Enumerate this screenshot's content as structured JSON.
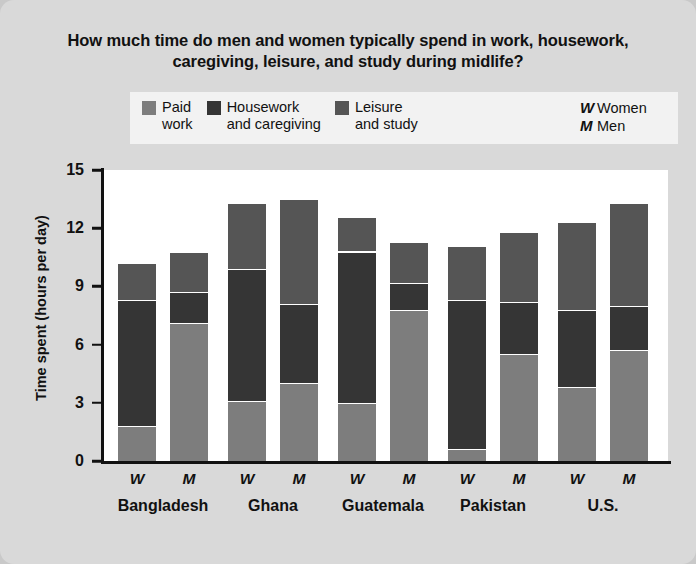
{
  "title": "How much time do men and women typically spend in work, housework, caregiving, leisure, and study during midlife?",
  "legend": {
    "items": [
      {
        "label": "Paid\nwork",
        "color": "#7d7d7d",
        "key": "paid"
      },
      {
        "label": "Housework\nand caregiving",
        "color": "#353535",
        "key": "house"
      },
      {
        "label": "Leisure\nand study",
        "color": "#555555",
        "key": "leisure"
      }
    ],
    "keys": [
      {
        "symbol": "W",
        "meaning": "Women"
      },
      {
        "symbol": "M",
        "meaning": "Men"
      }
    ]
  },
  "axis": {
    "ylabel": "Time spent (hours per day)",
    "yticks": [
      "0",
      "3",
      "6",
      "9",
      "12",
      "15"
    ],
    "ymin": 0,
    "ymax": 15
  },
  "chart_data": {
    "type": "bar",
    "title": "How much time do men and women typically spend in work, housework, caregiving, leisure, and study during midlife?",
    "xlabel": "",
    "ylabel": "Time spent (hours per day)",
    "ylim": [
      0,
      15
    ],
    "ytick_values": [
      0,
      3,
      6,
      9,
      12,
      15
    ],
    "grid": false,
    "stacked": true,
    "legend_position": "top",
    "categories": [
      "Bangladesh",
      "Ghana",
      "Guatemala",
      "Pakistan",
      "U.S."
    ],
    "subcategories": [
      "W",
      "M"
    ],
    "series": [
      {
        "name": "Paid work",
        "color": "#7d7d7d",
        "values": {
          "Bangladesh": {
            "W": 1.8,
            "M": 7.1
          },
          "Ghana": {
            "W": 3.1,
            "M": 4.0
          },
          "Guatemala": {
            "W": 3.0,
            "M": 7.8
          },
          "Pakistan": {
            "W": 0.6,
            "M": 5.5
          },
          "U.S.": {
            "W": 3.8,
            "M": 5.7
          }
        }
      },
      {
        "name": "Housework and caregiving",
        "color": "#353535",
        "values": {
          "Bangladesh": {
            "W": 6.5,
            "M": 1.6
          },
          "Ghana": {
            "W": 6.8,
            "M": 4.1
          },
          "Guatemala": {
            "W": 7.8,
            "M": 1.4
          },
          "Pakistan": {
            "W": 7.7,
            "M": 2.7
          },
          "U.S.": {
            "W": 4.0,
            "M": 2.3
          }
        }
      },
      {
        "name": "Leisure and study",
        "color": "#555555",
        "values": {
          "Bangladesh": {
            "W": 1.9,
            "M": 2.1
          },
          "Ghana": {
            "W": 3.4,
            "M": 5.4
          },
          "Guatemala": {
            "W": 1.8,
            "M": 2.1
          },
          "Pakistan": {
            "W": 2.8,
            "M": 3.6
          },
          "U.S.": {
            "W": 4.5,
            "M": 5.3
          }
        }
      }
    ],
    "totals": {
      "Bangladesh": {
        "W": 10.2,
        "M": 10.8
      },
      "Ghana": {
        "W": 13.3,
        "M": 13.5
      },
      "Guatemala": {
        "W": 12.6,
        "M": 11.3
      },
      "Pakistan": {
        "W": 11.1,
        "M": 11.8
      },
      "U.S.": {
        "W": 12.3,
        "M": 13.3
      }
    }
  }
}
